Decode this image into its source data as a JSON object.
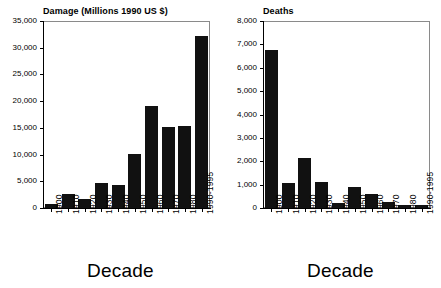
{
  "figure": {
    "background_color": "#ffffff",
    "bar_color": "#111111",
    "frame_color": "#8a8a8a"
  },
  "chart_data": [
    {
      "type": "bar",
      "title": "Damage (Millions 1990 US $)",
      "xlabel": "Decade",
      "ylabel": "",
      "categories": [
        "1900",
        "1910",
        "1920",
        "1930",
        "1940",
        "1950",
        "1960",
        "1970",
        "1980",
        "1990-1995"
      ],
      "values": [
        700,
        2600,
        1750,
        4600,
        4250,
        10200,
        19100,
        15200,
        15400,
        32200
      ],
      "ylim": [
        0,
        35000
      ],
      "yticks": [
        0,
        5000,
        10000,
        15000,
        20000,
        25000,
        30000,
        35000
      ],
      "ytick_labels": [
        "0",
        "5,000",
        "10,000",
        "15,000",
        "20,000",
        "25,000",
        "30,000",
        "35,000"
      ],
      "grid": false,
      "legend": "none"
    },
    {
      "type": "bar",
      "title": "Deaths",
      "xlabel": "Decade",
      "ylabel": "",
      "categories": [
        "1900",
        "1910",
        "1920",
        "1930",
        "1940",
        "1950",
        "1960",
        "1970",
        "1980",
        "1990-1995"
      ],
      "values": [
        6750,
        1050,
        2150,
        1120,
        230,
        920,
        620,
        270,
        150,
        150
      ],
      "ylim": [
        0,
        8000
      ],
      "yticks": [
        0,
        1000,
        2000,
        3000,
        4000,
        5000,
        6000,
        7000,
        8000
      ],
      "ytick_labels": [
        "0",
        "1,000",
        "2,000",
        "3,000",
        "4,000",
        "5,000",
        "6,000",
        "7,000",
        "8,000"
      ],
      "grid": false,
      "legend": "none"
    }
  ]
}
